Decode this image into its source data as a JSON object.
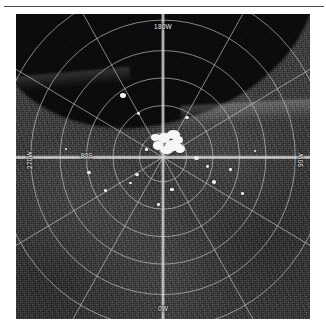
{
  "figure": {
    "kind": "polar-projection radar image",
    "panel_background": "#000000",
    "frame_background": "#ffffff",
    "rule_color": "#4a4a4a"
  },
  "labels": {
    "top": "180W",
    "bottom": "0W",
    "left": "270W",
    "right": "90W",
    "latitude": "80S"
  },
  "graticule": {
    "grid_color": "#cfcfcf",
    "ring_count": 6,
    "spoke_count": 12,
    "center_x_pct": 50,
    "center_y_pct": 47,
    "ring_radii_pct": [
      8,
      17,
      26,
      35,
      45,
      56
    ],
    "spoke_step_degrees": 30
  },
  "scene": {
    "terrain_tone": "#2b2b2b",
    "nodata_tone": "#050505",
    "feature_tone": "#f2f2f2",
    "pole_deposit_label": "bright polar deposit",
    "bright_spots": [
      {
        "x_pct": 35.5,
        "y_pct": 26.0,
        "w_pct": 1.9,
        "h_pct": 1.6
      },
      {
        "x_pct": 41.0,
        "y_pct": 32.0,
        "w_pct": 1.1,
        "h_pct": 1.0
      },
      {
        "x_pct": 57.5,
        "y_pct": 33.5,
        "w_pct": 1.2,
        "h_pct": 1.0
      },
      {
        "x_pct": 60.5,
        "y_pct": 46.5,
        "w_pct": 1.6,
        "h_pct": 1.3
      },
      {
        "x_pct": 64.5,
        "y_pct": 49.5,
        "w_pct": 1.1,
        "h_pct": 1.0
      },
      {
        "x_pct": 66.5,
        "y_pct": 54.5,
        "w_pct": 1.4,
        "h_pct": 1.2
      },
      {
        "x_pct": 72.5,
        "y_pct": 50.5,
        "w_pct": 1.0,
        "h_pct": 0.9
      },
      {
        "x_pct": 40.5,
        "y_pct": 52.0,
        "w_pct": 1.5,
        "h_pct": 1.2
      },
      {
        "x_pct": 38.5,
        "y_pct": 55.0,
        "w_pct": 1.0,
        "h_pct": 0.9
      },
      {
        "x_pct": 24.0,
        "y_pct": 51.5,
        "w_pct": 1.4,
        "h_pct": 1.1
      },
      {
        "x_pct": 30.0,
        "y_pct": 57.5,
        "w_pct": 1.0,
        "h_pct": 0.9
      },
      {
        "x_pct": 52.5,
        "y_pct": 57.0,
        "w_pct": 1.1,
        "h_pct": 0.9
      },
      {
        "x_pct": 76.5,
        "y_pct": 58.5,
        "w_pct": 1.0,
        "h_pct": 0.9
      },
      {
        "x_pct": 48.0,
        "y_pct": 62.0,
        "w_pct": 0.9,
        "h_pct": 0.8
      },
      {
        "x_pct": 44.0,
        "y_pct": 44.0,
        "w_pct": 0.9,
        "h_pct": 0.8
      },
      {
        "x_pct": 55.5,
        "y_pct": 42.5,
        "w_pct": 0.9,
        "h_pct": 0.8
      },
      {
        "x_pct": 16.5,
        "y_pct": 44.0,
        "w_pct": 0.8,
        "h_pct": 0.7
      },
      {
        "x_pct": 81.0,
        "y_pct": 44.5,
        "w_pct": 0.8,
        "h_pct": 0.7
      }
    ],
    "deposit_blobs": [
      {
        "x_pct": 18,
        "y_pct": 10,
        "w_pct": 30,
        "h_pct": 34
      },
      {
        "x_pct": 42,
        "y_pct": 2,
        "w_pct": 34,
        "h_pct": 30
      },
      {
        "x_pct": 4,
        "y_pct": 38,
        "w_pct": 28,
        "h_pct": 30
      },
      {
        "x_pct": 36,
        "y_pct": 36,
        "w_pct": 38,
        "h_pct": 36
      },
      {
        "x_pct": 58,
        "y_pct": 20,
        "w_pct": 26,
        "h_pct": 30
      },
      {
        "x_pct": 24,
        "y_pct": 56,
        "w_pct": 32,
        "h_pct": 28
      },
      {
        "x_pct": 62,
        "y_pct": 52,
        "w_pct": 26,
        "h_pct": 28
      },
      {
        "x_pct": 0,
        "y_pct": 14,
        "w_pct": 22,
        "h_pct": 24
      }
    ]
  }
}
